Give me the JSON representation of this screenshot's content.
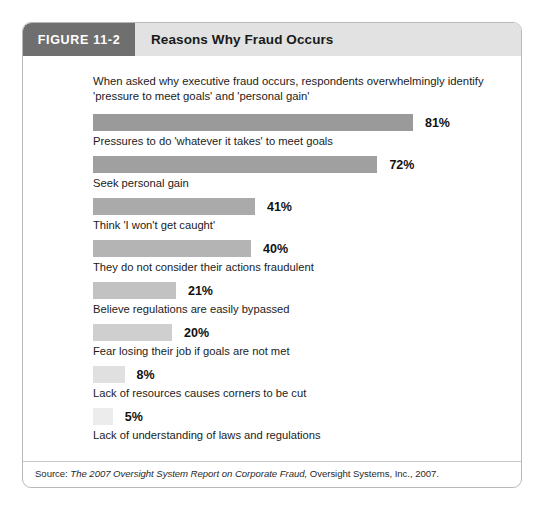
{
  "header": {
    "figure_tag": "FIGURE 11-2",
    "title": "Reasons Why Fraud Occurs"
  },
  "intro": "When asked why executive fraud occurs, respondents overwhelmingly identify 'pressure to meet goals' and 'personal gain'",
  "source": {
    "prefix": "Source: ",
    "italic_title": "The 2007 Oversight System Report on Corporate Fraud,",
    "suffix": " Oversight Systems, Inc., 2007."
  },
  "colors": {
    "tag_bg": "#6f6f6f",
    "header_bg": "#e2e2e2",
    "card_border": "#b9b9b9",
    "bar_darkest": "#9a9a9a",
    "bar_lightest": "#ececec"
  },
  "chart_data": {
    "type": "bar",
    "title": "Reasons Why Fraud Occurs",
    "subtitle": "When asked why executive fraud occurs, respondents overwhelmingly identify 'pressure to meet goals' and 'personal gain'",
    "xlabel": "",
    "ylabel": "",
    "xlim": [
      0,
      100
    ],
    "grid": false,
    "orientation": "horizontal",
    "unit": "%",
    "categories": [
      "Pressures to do 'whatever it takes' to meet goals",
      "Seek personal gain",
      "Think 'I won't get caught'",
      "They do not consider their actions fraudulent",
      "Believe regulations are easily bypassed",
      "Fear losing their job if goals are not met",
      "Lack of resources causes corners to be cut",
      "Lack of understanding of laws and regulations"
    ],
    "values": [
      81,
      72,
      41,
      40,
      21,
      20,
      8,
      5
    ],
    "value_labels": [
      "81%",
      "72%",
      "41%",
      "40%",
      "21%",
      "20%",
      "8%",
      "5%"
    ],
    "bar_colors": [
      "#9a9a9a",
      "#a0a0a0",
      "#aaaaaa",
      "#b4b4b4",
      "#c2c2c2",
      "#cfcfcf",
      "#e0e0e0",
      "#ececec"
    ],
    "source": "Source: The 2007 Oversight System Report on Corporate Fraud, Oversight Systems, Inc., 2007."
  }
}
